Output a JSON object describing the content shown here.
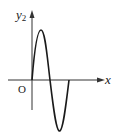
{
  "diagram": {
    "y_axis_label": "y",
    "y_axis_subscript": "2",
    "x_axis_label": "x",
    "origin_label": "O",
    "curve": "one full period of a sine wave starting at the origin: rises to a peak, crosses the x axis, falls to a trough, returns to the x axis",
    "colors": {
      "line": "#1a1a1a",
      "axis": "#333333",
      "background": "#ffffff"
    }
  }
}
